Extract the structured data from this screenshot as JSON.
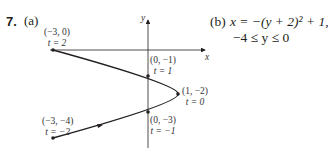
{
  "problem": {
    "number": "7.",
    "part_a_label": "(a)",
    "part_b_label": "(b)",
    "part_b_equation": "x = −(y + 2)² + 1,",
    "part_b_domain": "−4 ≤ y ≤ 0"
  },
  "axes": {
    "x_label": "x",
    "y_label": "y"
  },
  "points": [
    {
      "coord": "(−3, 0)",
      "param": "t = 2"
    },
    {
      "coord": "(0, −1)",
      "param": "t = 1"
    },
    {
      "coord": "(1, −2)",
      "param": "t = 0"
    },
    {
      "coord": "(0, −3)",
      "param": "t = −1"
    },
    {
      "coord": "(−3, −4)",
      "param": "t = −2"
    }
  ],
  "curve": {
    "description": "parabola opening left, x = -(y+2)^2 + 1, traced from (-3,-4) to (-3,0) as t decreases from -2... direction arrow on lower branch pointing right",
    "color": "#231f20"
  }
}
